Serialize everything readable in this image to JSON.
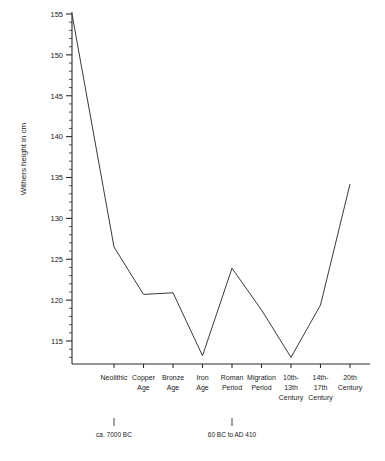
{
  "chart_data": {
    "type": "line",
    "title": "",
    "xlabel": "",
    "ylabel": "Withers height in cm",
    "categories": [
      "Neolithic",
      "Copper Age",
      "Bronze Age",
      "Iron Age",
      "Roman Period",
      "Migration Period",
      "10th-13th Century",
      "14th-17th Century",
      "20th Century"
    ],
    "category_lines": [
      [
        "Neolithic"
      ],
      [
        "Copper",
        "Age"
      ],
      [
        "Bronze",
        "Age"
      ],
      [
        "Iron",
        "Age"
      ],
      [
        "Roman",
        "Period"
      ],
      [
        "Migration",
        "Period"
      ],
      [
        "10th-",
        "13th",
        "Century"
      ],
      [
        "14th-",
        "17th",
        "Century"
      ],
      [
        "20th",
        "Century"
      ]
    ],
    "values": [
      126.5,
      120.7,
      120.9,
      113.2,
      123.9,
      118.8,
      113.0,
      119.4,
      134.2
    ],
    "start_value": 155.0,
    "start_at_axis": true,
    "ylim": [
      110.5,
      155.5
    ],
    "yticks": [
      115,
      120,
      125,
      130,
      135,
      140,
      145,
      150,
      155
    ],
    "ytick_labels": [
      "115",
      "120",
      "125",
      "130",
      "135",
      "140",
      "145",
      "150",
      "155"
    ],
    "y_minor_step": 1,
    "grid": false,
    "legend": "none",
    "annotations": [
      {
        "category": "Neolithic",
        "text": "ca. 7000 BC"
      },
      {
        "category": "Roman Period",
        "text": "60 BC to AD 410"
      }
    ]
  },
  "axis": {
    "y_title": "Withers height in cm"
  },
  "notes": {
    "neolithic_date": "ca. 7000 BC",
    "roman_date": "60 BC to AD 410"
  }
}
